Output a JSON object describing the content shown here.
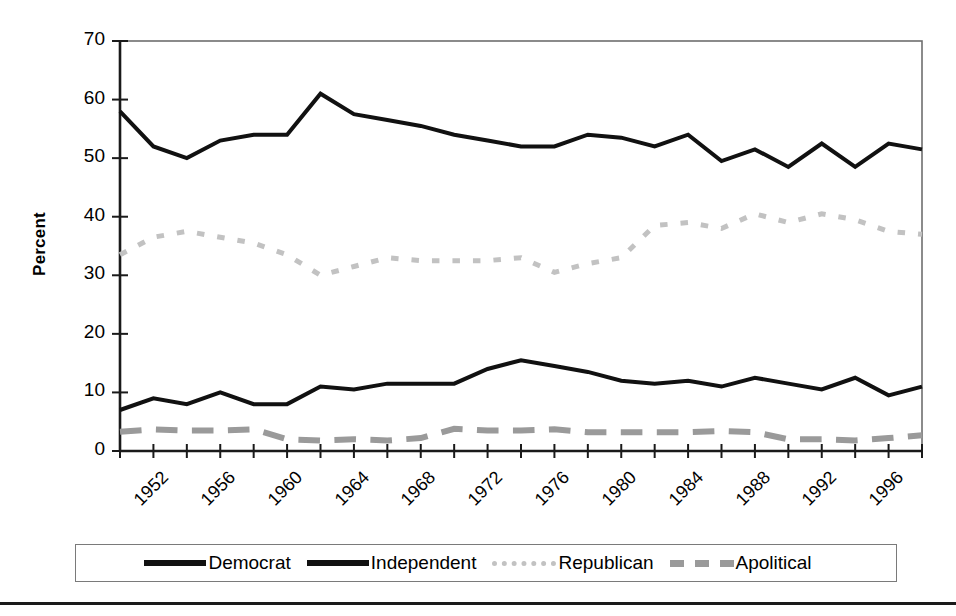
{
  "chart_data": {
    "type": "line",
    "title": "",
    "xlabel": "",
    "ylabel": "Percent",
    "ylim": [
      0,
      70
    ],
    "ytick_values": [
      0,
      10,
      20,
      30,
      40,
      50,
      60,
      70
    ],
    "ytick_labels": [
      "0",
      "10",
      "20",
      "30",
      "40",
      "50",
      "60",
      "70"
    ],
    "xlim": [
      1952,
      2000
    ],
    "x": [
      1952,
      1954,
      1956,
      1958,
      1960,
      1962,
      1964,
      1966,
      1968,
      1970,
      1972,
      1974,
      1976,
      1978,
      1980,
      1982,
      1984,
      1986,
      1988,
      1990,
      1992,
      1994,
      1996,
      1998,
      2000
    ],
    "xtick_values": [
      1952,
      1954,
      1956,
      1958,
      1960,
      1962,
      1964,
      1966,
      1968,
      1970,
      1972,
      1974,
      1976,
      1978,
      1980,
      1982,
      1984,
      1986,
      1988,
      1990,
      1992,
      1994,
      1996,
      1998,
      2000
    ],
    "xtick_labels": [
      "1952",
      "1956",
      "1960",
      "1964",
      "1968",
      "1972",
      "1976",
      "1980",
      "1984",
      "1988",
      "1992",
      "1996"
    ],
    "xtick_label_values": [
      1952,
      1956,
      1960,
      1964,
      1968,
      1972,
      1976,
      1980,
      1984,
      1988,
      1992,
      1996
    ],
    "grid": false,
    "legend_position": "bottom",
    "series": [
      {
        "name": "Democrat",
        "style": "solid",
        "color": "#111111",
        "width": 4,
        "values": [
          58,
          52,
          50,
          53,
          54,
          54,
          61,
          57.5,
          56.5,
          55.5,
          54,
          53,
          52,
          52,
          54,
          53.5,
          52,
          54,
          49.5,
          51.5,
          48.5,
          52.5,
          48.5,
          52.5,
          51.5
        ]
      },
      {
        "name": "Independent",
        "style": "solid",
        "color": "#111111",
        "width": 4,
        "values": [
          7,
          9,
          8,
          10,
          8,
          8,
          11,
          10.5,
          11.5,
          11.5,
          11.5,
          14,
          15.5,
          14.5,
          13.5,
          12,
          11.5,
          12,
          11,
          12.5,
          11.5,
          10.5,
          12.5,
          9.5,
          11
        ]
      },
      {
        "name": "Republican",
        "style": "dotted",
        "color": "#c2c2c2",
        "width": 5,
        "values": [
          33.5,
          36.5,
          37.5,
          36.5,
          35.5,
          33.5,
          30,
          31.5,
          33,
          32.5,
          32.5,
          32.5,
          33,
          30.5,
          32,
          33,
          38.5,
          39,
          38,
          40.5,
          39,
          40.5,
          39.5,
          37.5,
          37
        ]
      },
      {
        "name": "Apolitical",
        "style": "dashed",
        "color": "#9a9a9a",
        "width": 6,
        "values": [
          3.3,
          3.7,
          3.5,
          3.5,
          3.7,
          2,
          1.8,
          2,
          1.8,
          2.2,
          3.8,
          3.5,
          3.5,
          3.7,
          3.2,
          3.2,
          3.2,
          3.2,
          3.4,
          3.2,
          2,
          2,
          1.8,
          2.2,
          2.7
        ]
      }
    ]
  },
  "legend": {
    "items": [
      {
        "label": "Democrat",
        "swatch": "solid-line-swatch"
      },
      {
        "label": "Independent",
        "swatch": "solid-line-swatch"
      },
      {
        "label": "Republican",
        "swatch": "dotted-line-swatch"
      },
      {
        "label": "Apolitical",
        "swatch": "dashed-line-swatch"
      }
    ]
  }
}
